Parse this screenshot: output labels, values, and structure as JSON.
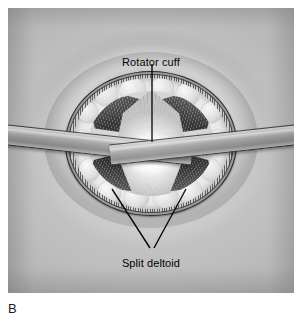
{
  "figure": {
    "caption_letter": "B",
    "background_color": "#c9c9c9",
    "panel": {
      "x": 8,
      "y": 8,
      "width": 286,
      "height": 285
    }
  },
  "labels": {
    "rotator_cuff": "Rotator cuff",
    "split_deltoid": "Split deltoid"
  },
  "anatomy": {
    "skin_edge": "skin-incision-edge",
    "dermis_band": "dermis-hatched-band",
    "subcutaneous_fat": "subcutaneous-fat-lobules",
    "deltoid_upper_left": "deltoid-muscle-upper-left",
    "deltoid_upper_right": "deltoid-muscle-upper-right",
    "deltoid_lower_left": "deltoid-muscle-lower-left",
    "deltoid_lower_right": "deltoid-muscle-lower-right",
    "rotator_cuff_surface": "rotator-cuff-exposed"
  },
  "instruments": {
    "left_retractor": "army-navy-retractor-left",
    "right_retractor": "army-navy-retractor-right"
  },
  "leader_lines": {
    "rotator_cuff_line": {
      "from_x": 152,
      "from_y": 62,
      "to_x": 152,
      "to_y": 140
    },
    "split_deltoid_left": {
      "from_x": 150,
      "from_y": 246,
      "to_x": 112,
      "to_y": 189
    },
    "split_deltoid_right": {
      "from_x": 154,
      "from_y": 246,
      "to_x": 186,
      "to_y": 189
    }
  },
  "colors": {
    "background": "#c9c9c9",
    "muscle_dark": "#242424",
    "cuff_white": "#ffffff",
    "ink": "#000000",
    "metal": "#9a9a9a"
  }
}
